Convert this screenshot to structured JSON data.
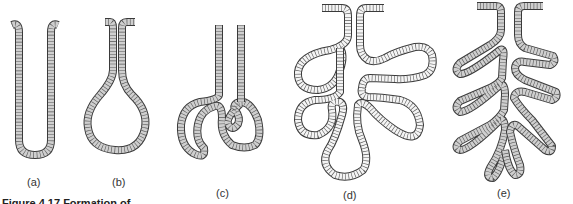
{
  "figure": {
    "caption": "Figure 4.17 Formation of...",
    "panels": [
      {
        "id": "a",
        "label": "(a)",
        "description": "simple tubular gland"
      },
      {
        "id": "b",
        "label": "(b)",
        "description": "simple flask-shaped (alveolar) gland"
      },
      {
        "id": "c",
        "label": "(c)",
        "description": "coiled tubular gland"
      },
      {
        "id": "d",
        "label": "(d)",
        "description": "compound alveolar gland"
      },
      {
        "id": "e",
        "label": "(e)",
        "description": "compound tubular branched gland"
      }
    ],
    "colors": {
      "outline": "#3a3a3a",
      "fill_gray": "#cfcfcf",
      "fill_white": "#f4f4f4",
      "hatch": "#555555",
      "background": "#ffffff"
    }
  }
}
